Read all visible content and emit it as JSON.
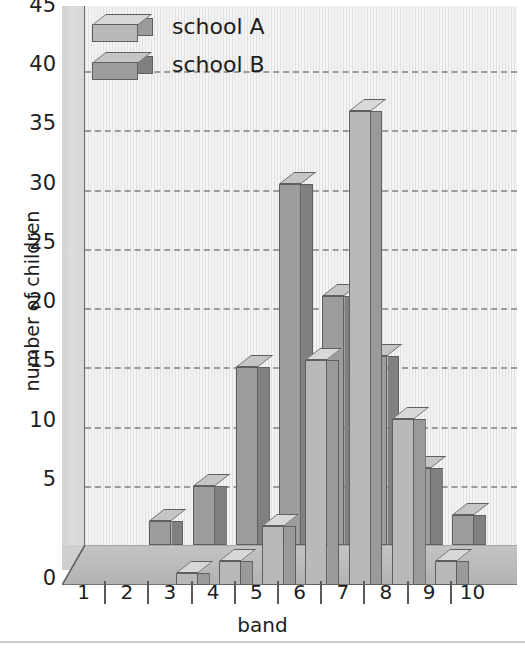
{
  "chart_data": {
    "type": "bar",
    "title": "",
    "subtitle": "",
    "xlabel": "band",
    "ylabel": "number of children",
    "categories": [
      "1",
      "2",
      "3",
      "4",
      "5",
      "6",
      "7",
      "8",
      "9",
      "10"
    ],
    "ylim": [
      0,
      45
    ],
    "ytick_step": 5,
    "yticks": [
      "45",
      "40",
      "35",
      "30",
      "25",
      "20",
      "15",
      "10",
      "5",
      "0"
    ],
    "grid": true,
    "grid_style": "dashed-horizontal",
    "legend_position": "top-left",
    "style": "3d-bar",
    "series": [
      {
        "name": "school A",
        "color": "#b9b9b9",
        "side_color": "#9a9a9a",
        "top_color": "#d8d8d8",
        "values": [
          0,
          0,
          1,
          2,
          5,
          19,
          40,
          14,
          2,
          0
        ]
      },
      {
        "name": "school B",
        "color": "#9d9d9d",
        "side_color": "#808080",
        "top_color": "#c5c5c5",
        "values": [
          0,
          2,
          5,
          15,
          30.5,
          21,
          16,
          6.5,
          2.5,
          0
        ]
      }
    ],
    "annotations": []
  },
  "legend": {
    "items": [
      {
        "label": "school A",
        "icon": "cuboid-swatch-icon"
      },
      {
        "label": "school B",
        "icon": "cuboid-swatch-icon"
      }
    ]
  },
  "axes": {
    "y_title": "number of children",
    "x_title": "band",
    "y_tick_labels": [
      "45",
      "40",
      "35",
      "30",
      "25",
      "20",
      "15",
      "10",
      "5",
      "0"
    ],
    "x_tick_labels": [
      "1",
      "2",
      "3",
      "4",
      "5",
      "6",
      "7",
      "8",
      "9",
      "10"
    ]
  },
  "colors": {
    "plot_background": "#f4f4f4",
    "left_wall": "#d8d8d8",
    "floor": "#b8b8b8",
    "gridline": "#8d8d8d",
    "text": "#1d1d1d",
    "school_a": "#b9b9b9",
    "school_b": "#9d9d9d"
  }
}
